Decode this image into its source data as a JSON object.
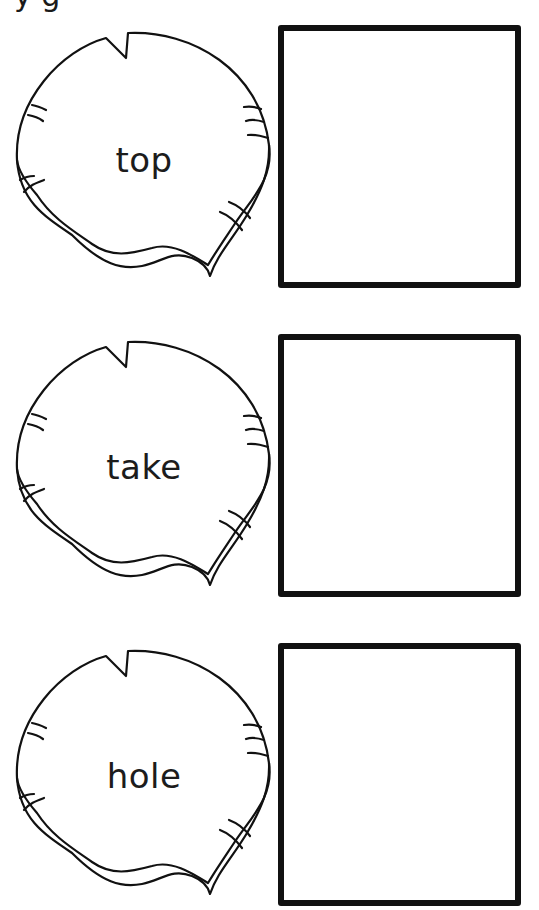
{
  "worksheet": {
    "header_partial": "y      g",
    "items": [
      {
        "word": "top"
      },
      {
        "word": "take"
      },
      {
        "word": "hole"
      }
    ],
    "colors": {
      "line": "#111111",
      "background": "#ffffff",
      "text": "#1c1c1c"
    }
  }
}
